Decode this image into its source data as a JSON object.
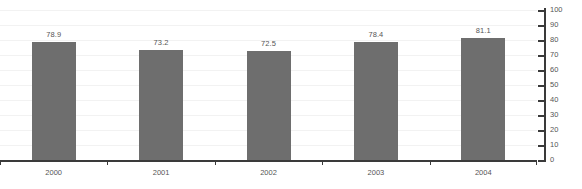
{
  "chart_data": {
    "type": "bar",
    "title": "",
    "xlabel": "",
    "ylabel": "",
    "categories": [
      "2000",
      "2001",
      "2002",
      "2003",
      "2004"
    ],
    "values": [
      78.9,
      73.2,
      72.5,
      78.4,
      81.1
    ],
    "value_labels": [
      "78.9",
      "73.2",
      "72.5",
      "78.4",
      "81.1"
    ],
    "ylim": [
      0,
      100
    ],
    "ytick_step": 10,
    "ytick_labels": [
      "100",
      "90",
      "80",
      "70",
      "60",
      "50",
      "40",
      "30",
      "20",
      "10",
      "0"
    ],
    "ytick_values": [
      100,
      90,
      80,
      70,
      60,
      50,
      40,
      30,
      20,
      10,
      0
    ],
    "grid": true,
    "axis_position": "right",
    "legend": "none",
    "colors": {
      "bar": "#6e6e6e",
      "gridline": "#f2f2f2",
      "axis": "#3a3a3a",
      "text": "#555555",
      "background": "#ffffff"
    }
  }
}
